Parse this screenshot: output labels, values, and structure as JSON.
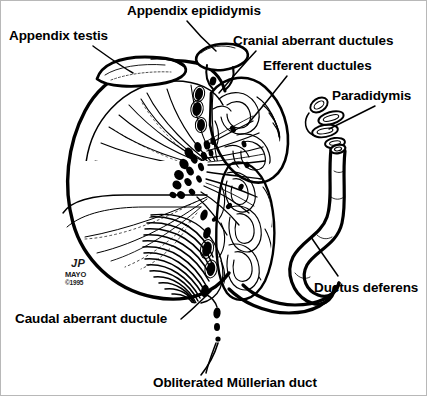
{
  "figure": {
    "background_color": "#ffffff",
    "ink_color": "#000000",
    "border_color": "#b8b8b8",
    "width": 427,
    "height": 396
  },
  "labels": [
    {
      "id": "appendix-testis",
      "text": "Appendix testis",
      "x": 8,
      "y": 28,
      "leader": "from label down-right to small teardrop body above upper-left testis"
    },
    {
      "id": "appendix-epididymis",
      "text": "Appendix epididymis",
      "x": 126,
      "y": 3,
      "leader": "from label down-right to stalked oval at top of epididymis head"
    },
    {
      "id": "cranial-aberrant-ductules",
      "text": "Cranial aberrant ductules",
      "x": 232,
      "y": 33,
      "leader": "from label down-left into upper epididymal tubule cluster"
    },
    {
      "id": "efferent-ductules",
      "text": "Efferent ductules",
      "x": 262,
      "y": 58,
      "leader": "from label down-left to fan of ductules leaving the rete testis"
    },
    {
      "id": "paradidymis",
      "text": "Paradidymis",
      "x": 331,
      "y": 88,
      "leader": "from label down-left to isolated coiled tubule loops"
    },
    {
      "id": "ductus-deferens",
      "text": "Ductus deferens",
      "x": 313,
      "y": 280,
      "leader": "from label up-left to thick looping duct"
    },
    {
      "id": "caudal-aberrant-ductule",
      "text": "Caudal aberrant ductule",
      "x": 14,
      "y": 311,
      "leader": "from label up-right to small ductule near epididymal tail"
    },
    {
      "id": "obliterated-mullerian-duct",
      "text": "Obliterated Müllerian duct",
      "x": 152,
      "y": 375,
      "leader": "from label up to thin vertical strand of dark beads"
    }
  ],
  "credit": {
    "initials": "JP",
    "institution": "MAYO",
    "copyright": "©1995",
    "x": 64,
    "y": 258
  },
  "structures": [
    {
      "id": "testis",
      "name": "Testis (sagittal section)",
      "description": "Large ovoid organ at left, sectioned to show radiating seminiferous tubule lobules converging on the mediastinum testis"
    },
    {
      "id": "tunica-albuginea",
      "name": "Tunica albuginea",
      "description": "Thick dark capsule outlining the testis"
    },
    {
      "id": "rete-testis",
      "name": "Rete testis",
      "description": "Dark stippled channels at the hilum where lobules converge"
    },
    {
      "id": "epididymis-head",
      "name": "Head of epididymis",
      "description": "Convoluted tubular mass capping the upper posterior testis"
    },
    {
      "id": "epididymis-body",
      "name": "Body of epididymis",
      "description": "Coiled duct descending along the posterior testis"
    },
    {
      "id": "epididymis-tail",
      "name": "Tail of epididymis",
      "description": "Lower coiled portion continuing into the ductus deferens"
    },
    {
      "id": "appendix-testis-body",
      "name": "Appendix testis",
      "description": "Flattened teardrop remnant on the upper testis pole"
    },
    {
      "id": "appendix-epididymis-body",
      "name": "Appendix epididymis",
      "description": "Stalked oval vesicle on the epididymal head"
    },
    {
      "id": "paradidymis-body",
      "name": "Paradidymis",
      "description": "Cluster of small detached coiled tubules lateral to the epididymis"
    },
    {
      "id": "ductus-deferens-body",
      "name": "Ductus deferens",
      "description": "Thick-walled duct with a cut open end, looping downward and back"
    },
    {
      "id": "mullerian-remnant",
      "name": "Obliterated Müllerian duct",
      "description": "Fine beaded strand running inferiorly from the epididymal tail"
    }
  ]
}
